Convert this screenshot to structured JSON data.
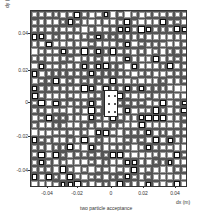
{
  "chart_data": {
    "type": "heatmap",
    "title": "",
    "caption": "two particle acceptance",
    "xlabel": "dx (m)",
    "ylabel": "dy (m)",
    "xlim": [
      -0.05,
      0.05
    ],
    "ylim": [
      -0.055,
      0.055
    ],
    "xticks": [
      {
        "value": -0.04,
        "label": "-0.04",
        "px": 47
      },
      {
        "value": -0.02,
        "label": "-0.02",
        "px": 77
      },
      {
        "value": 0,
        "label": "0",
        "px": 111
      },
      {
        "value": 0.02,
        "label": "0.02",
        "px": 143
      },
      {
        "value": 0.04,
        "label": "0.04",
        "px": 175
      }
    ],
    "yticks": [
      {
        "value": 0.04,
        "label": "0.04",
        "px": 33
      },
      {
        "value": 0.02,
        "label": "0.02",
        "px": 70
      },
      {
        "value": 0,
        "label": "0",
        "px": 102
      },
      {
        "value": -0.02,
        "label": "-0.02",
        "px": 136
      },
      {
        "value": -0.04,
        "label": "-0.04",
        "px": 170
      }
    ],
    "grid": {
      "cols": 22,
      "rows": 24,
      "description": "box-size plot, roughly uniform acceptance with central low-acceptance hole near (0,0)"
    },
    "hole": {
      "x_range": [
        -0.0025,
        0.0045
      ],
      "y_range": [
        -0.0085,
        0.0085
      ]
    },
    "colors": {
      "box_fill": "#ffffff",
      "box_edge": "#444444",
      "background": "#555555"
    }
  }
}
